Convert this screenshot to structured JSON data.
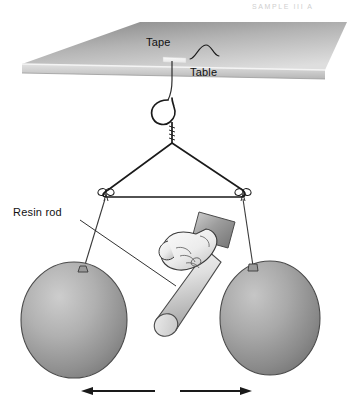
{
  "figure": {
    "background_color": "#ffffff",
    "artifact_text": "SAMPLE   III   A"
  },
  "labels": {
    "tape": "Tape",
    "table": "Table",
    "resin_rod": "Resin rod"
  },
  "colors": {
    "ink": "#111111",
    "string": "#3a3a3a",
    "balloon_light": "#c9c9c9",
    "balloon_mid": "#9a9a9a",
    "balloon_dark": "#6e6e6e",
    "table_top_dark": "#8e8e8e",
    "table_top_light": "#d8d8d8",
    "table_edge": "#cfcfcf",
    "tape_strip": "#f2f2f2",
    "skin_light": "#f2f2f2",
    "skin_shade": "#b8b8b8",
    "rod_light": "#ededed",
    "rod_shade": "#9f9f9f",
    "sleeve": "#8f8f8f",
    "arrow": "#1a1a1a"
  },
  "objects": {
    "table": {
      "name": "table",
      "top_surface": "parallelogram",
      "edge_band": "front edge"
    },
    "tape": {
      "name": "tape-strip",
      "note": "white adhesive strip holding string to table underside"
    },
    "hanger": {
      "name": "wire-coat-hanger",
      "hook": "open hook at top",
      "knots": 2,
      "knot_style": "bow"
    },
    "balloons": [
      {
        "name": "balloon-left",
        "position": "left",
        "knot_side": "top-right"
      },
      {
        "name": "balloon-right",
        "position": "right",
        "knot_side": "top-left"
      }
    ],
    "hand": {
      "name": "hand-holding-rod",
      "grip": "fist around rod",
      "sleeve": "shaded cuff"
    },
    "rod": {
      "name": "resin-rod",
      "shape": "cylinder",
      "orientation": "angled down-left"
    },
    "arrows": [
      {
        "name": "arrow-left",
        "direction": "left",
        "meaning": "repulsion"
      },
      {
        "name": "arrow-right",
        "direction": "right",
        "meaning": "repulsion"
      }
    ]
  }
}
